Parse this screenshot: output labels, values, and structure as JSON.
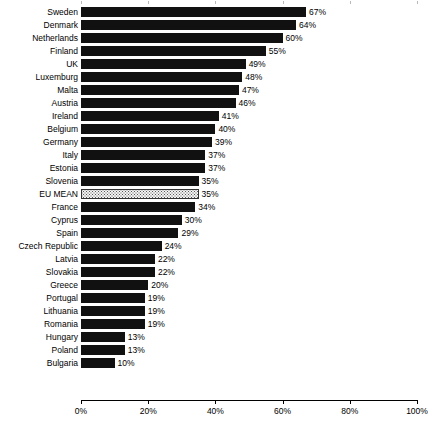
{
  "chart_data": {
    "type": "bar",
    "orientation": "horizontal",
    "title": "",
    "subtitle": "",
    "xlabel": "",
    "ylabel": "",
    "xlim": [
      0,
      100
    ],
    "grid": false,
    "legend": null,
    "value_suffix": "%",
    "highlight_category": "EU MEAN",
    "xticks": [
      "0%",
      "20%",
      "40%",
      "60%",
      "80%",
      "100%"
    ],
    "xtick_values": [
      0,
      20,
      40,
      60,
      80,
      100
    ],
    "categories": [
      "Sweden",
      "Denmark",
      "Netherlands",
      "Finland",
      "UK",
      "Luxemburg",
      "Malta",
      "Austria",
      "Ireland",
      "Belgium",
      "Germany",
      "Italy",
      "Estonia",
      "Slovenia",
      "EU MEAN",
      "France",
      "Cyprus",
      "Spain",
      "Czech Republic",
      "Latvia",
      "Slovakia",
      "Greece",
      "Portugal",
      "Lithuania",
      "Romania",
      "Hungary",
      "Poland",
      "Bulgaria"
    ],
    "values": [
      67,
      64,
      60,
      55,
      49,
      48,
      47,
      46,
      41,
      40,
      39,
      37,
      37,
      35,
      35,
      34,
      30,
      29,
      24,
      22,
      22,
      20,
      19,
      19,
      19,
      13,
      13,
      10
    ],
    "labels": [
      "67%",
      "64%",
      "60%",
      "55%",
      "49%",
      "48%",
      "47%",
      "46%",
      "41%",
      "40%",
      "39%",
      "37%",
      "37%",
      "35%",
      "35%",
      "34%",
      "30%",
      "29%",
      "24%",
      "22%",
      "22%",
      "20%",
      "19%",
      "19%",
      "19%",
      "13%",
      "13%",
      "10%"
    ],
    "colors": {
      "bar": "#111111",
      "highlight_fill": "#f2f2f2",
      "highlight_border": "#333333",
      "axis": "#000000",
      "text": "#000000",
      "background": "#ffffff"
    }
  }
}
